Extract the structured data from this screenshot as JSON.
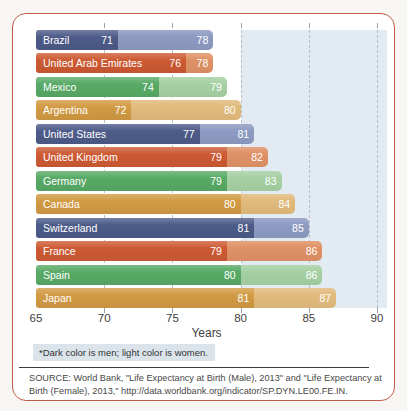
{
  "chart_data": {
    "type": "bar",
    "orientation": "horizontal",
    "categories": [
      "Brazil",
      "United Arab Emirates",
      "Mexico",
      "Argentina",
      "United States",
      "United Kingdom",
      "Germany",
      "Canada",
      "Switzerland",
      "France",
      "Spain",
      "Japan"
    ],
    "series": [
      {
        "name": "Men",
        "values": [
          71,
          76,
          74,
          72,
          77,
          79,
          79,
          80,
          81,
          79,
          80,
          81
        ]
      },
      {
        "name": "Women",
        "values": [
          78,
          78,
          79,
          80,
          81,
          82,
          83,
          84,
          85,
          86,
          86,
          87
        ]
      }
    ],
    "title": "",
    "xlabel": "Years",
    "ylabel": "",
    "xlim": [
      65,
      90
    ],
    "xticks": [
      65,
      70,
      75,
      80,
      85,
      90
    ],
    "grid": "dashed-vertical",
    "shaded_band_start": 80,
    "legend": "none (encoded by shade: dark = men, light = women)"
  },
  "footnote": {
    "text": "*Dark color is men; light color is women."
  },
  "source": {
    "text": "SOURCE: World Bank, \"Life Expectancy at Birth (Male), 2013\" and \"Life Expectancy at Birth (Female), 2013,\" http://data.worldbank.org/indicator/SP.DYN.LE00.FE.IN."
  },
  "colors": {
    "blue_dark": "#4d5b89",
    "blue_light": "#8d9ac1",
    "orange_dark": "#cd5a33",
    "orange_light": "#df9165",
    "green_dark": "#58aa66",
    "green_light": "#a5d0a3",
    "gold_dark": "#d29a43",
    "gold_light": "#e1ba7c",
    "row_color_cycle": [
      "blue",
      "orange",
      "green",
      "gold"
    ],
    "shaded_band": "#e3ebf2",
    "gridline": "#b5bec8",
    "card_border": "#c15b49",
    "footnote_bg": "#dce4eb",
    "axis_text": "#3e3e3e"
  }
}
